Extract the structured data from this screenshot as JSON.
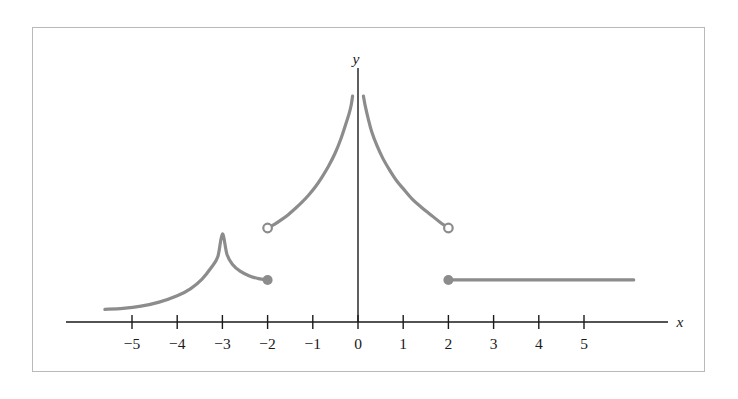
{
  "figure": {
    "background_color": "#ffffff",
    "frame_color": "#b9b9b9",
    "axis_color": "#1a1a1a",
    "curve_color": "#8c8c8c"
  },
  "chart_data": {
    "type": "line",
    "title": "",
    "subtitle": "",
    "xlabel": "x",
    "ylabel": "y",
    "xlim": [
      -6.2,
      6.5
    ],
    "ylim": [
      -0.45,
      5.2
    ],
    "grid": false,
    "legend": null,
    "x_ticks": [
      -5,
      -4,
      -3,
      -2,
      -1,
      0,
      1,
      2,
      3,
      4,
      5
    ],
    "x_tick_labels": [
      "−5",
      "−4",
      "−3",
      "−2",
      "−1",
      "0",
      "1",
      "2",
      "3",
      "4",
      "5"
    ],
    "y_ticks": [],
    "y_tick_labels": [],
    "vertical_asymptotes": [
      0
    ],
    "series": [
      {
        "name": "left-branch-cusp",
        "x_start": -5.6,
        "x_end": -2,
        "points": [
          [
            -5.6,
            0.28
          ],
          [
            -5.2,
            0.3
          ],
          [
            -4.8,
            0.35
          ],
          [
            -4.4,
            0.44
          ],
          [
            -4.0,
            0.58
          ],
          [
            -3.7,
            0.74
          ],
          [
            -3.45,
            0.95
          ],
          [
            -3.25,
            1.2
          ],
          [
            -3.1,
            1.45
          ],
          [
            -3.0,
            1.95
          ],
          [
            -2.9,
            1.5
          ],
          [
            -2.78,
            1.28
          ],
          [
            -2.6,
            1.12
          ],
          [
            -2.4,
            1.02
          ],
          [
            -2.2,
            0.96
          ],
          [
            -2.0,
            0.93
          ]
        ],
        "start_marker": "none",
        "end_marker": "closed",
        "end_point": [
          -2,
          0.93
        ]
      },
      {
        "name": "middle-left-branch",
        "x_start": -2,
        "x_end": 0,
        "points": [
          [
            -2.0,
            2.08
          ],
          [
            -1.85,
            2.16
          ],
          [
            -1.7,
            2.26
          ],
          [
            -1.55,
            2.37
          ],
          [
            -1.4,
            2.5
          ],
          [
            -1.25,
            2.64
          ],
          [
            -1.1,
            2.8
          ],
          [
            -0.95,
            2.98
          ],
          [
            -0.8,
            3.2
          ],
          [
            -0.65,
            3.45
          ],
          [
            -0.5,
            3.75
          ],
          [
            -0.38,
            4.05
          ],
          [
            -0.28,
            4.35
          ],
          [
            -0.2,
            4.6
          ],
          [
            -0.15,
            4.8
          ],
          [
            -0.12,
            5.0
          ]
        ],
        "start_marker": "open",
        "start_point": [
          -2,
          2.08
        ],
        "end_marker": "none"
      },
      {
        "name": "middle-right-branch",
        "x_start": 0,
        "x_end": 2,
        "points": [
          [
            0.12,
            5.0
          ],
          [
            0.16,
            4.78
          ],
          [
            0.22,
            4.52
          ],
          [
            0.3,
            4.22
          ],
          [
            0.42,
            3.9
          ],
          [
            0.55,
            3.62
          ],
          [
            0.7,
            3.36
          ],
          [
            0.85,
            3.13
          ],
          [
            1.0,
            2.95
          ],
          [
            1.2,
            2.72
          ],
          [
            1.4,
            2.54
          ],
          [
            1.6,
            2.38
          ],
          [
            1.8,
            2.22
          ],
          [
            2.0,
            2.08
          ]
        ],
        "start_marker": "none",
        "end_marker": "open",
        "end_point": [
          2,
          2.08
        ]
      },
      {
        "name": "right-horizontal-ray",
        "x_start": 2,
        "x_end": 6.1,
        "points": [
          [
            2.0,
            0.93
          ],
          [
            6.1,
            0.93
          ]
        ],
        "start_marker": "closed",
        "start_point": [
          2,
          0.93
        ],
        "end_marker": "none"
      }
    ]
  }
}
